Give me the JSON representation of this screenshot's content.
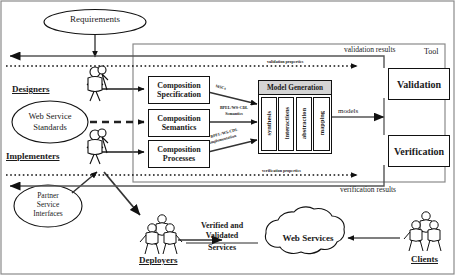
{
  "figure": {
    "tool_frame_label": "Tool"
  },
  "ellipses": {
    "requirements": "Requirements",
    "web_service_standards_line1": "Web Service",
    "web_service_standards_line2": "Standards",
    "partner_line1": "Partner",
    "partner_line2": "Service",
    "partner_line3": "Interfaces"
  },
  "actors": {
    "designers": "Designers",
    "implementers": "Implementers",
    "deployers": "Deployers",
    "clients": "Clients"
  },
  "boxes": {
    "composition_specification_l1": "Composition",
    "composition_specification_l2": "Specification",
    "composition_semantics_l1": "Composition",
    "composition_semantics_l2": "Semantics",
    "composition_processes_l1": "Composition",
    "composition_processes_l2": "Processes",
    "model_generation": "Model Generation",
    "validation": "Validation",
    "verification": "Verification"
  },
  "model_generation_columns": [
    {
      "label": "synthesis"
    },
    {
      "label": "interactions"
    },
    {
      "label": "abstraction"
    },
    {
      "label": "mapping"
    }
  ],
  "edge_labels": {
    "mscs": "MSCs",
    "bpel_semantics_l1": "BPEL/WS-CDL",
    "bpel_semantics_l2": "Semantics",
    "bpel_implementation_l1": "BPEL/WS-CDL",
    "bpel_implementation_l2": "implementation",
    "models": "models",
    "validation_properties": "validation properties",
    "validation_results": "validation results",
    "verification_properties": "verification properties",
    "verification_results": "verification results"
  },
  "output": {
    "verified_l1": "Verified and",
    "verified_l2": "Validated",
    "verified_l3": "Services",
    "web_services": "Web Services"
  },
  "colors": {
    "stroke": "#111111",
    "frame": "#8a8a8a",
    "header_fill": "#d4d4d4",
    "background": "#ffffff"
  }
}
